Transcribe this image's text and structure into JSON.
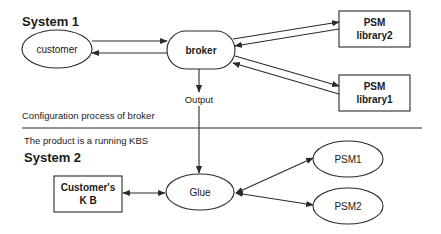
{
  "diagram": {
    "system1": {
      "title": "System 1",
      "nodes": {
        "customer": {
          "label": "customer",
          "shape": "ellipse"
        },
        "broker": {
          "label": "broker",
          "shape": "stadium"
        },
        "psm_library2": {
          "line1": "PSM",
          "line2": "library2",
          "shape": "rectangle"
        },
        "psm_library1": {
          "line1": "PSM",
          "line2": "library1",
          "shape": "rectangle"
        }
      },
      "caption": "Configuration process of broker"
    },
    "output_label": "Output",
    "system2": {
      "caption": "The product is a running KBS",
      "title": "System 2",
      "nodes": {
        "customers_kb": {
          "line1": "Customer's",
          "line2": "K B",
          "shape": "rectangle"
        },
        "glue": {
          "label": "Glue",
          "shape": "ellipse"
        },
        "psm1": {
          "label": "PSM1",
          "shape": "ellipse"
        },
        "psm2": {
          "label": "PSM2",
          "shape": "ellipse"
        }
      }
    },
    "edges": [
      {
        "from": "customer",
        "to": "broker"
      },
      {
        "from": "broker",
        "to": "customer"
      },
      {
        "from": "broker",
        "to": "psm_library2"
      },
      {
        "from": "psm_library2",
        "to": "broker"
      },
      {
        "from": "broker",
        "to": "psm_library1"
      },
      {
        "from": "psm_library1",
        "to": "broker"
      },
      {
        "from": "broker",
        "to": "glue",
        "label": "Output"
      },
      {
        "from": "customers_kb",
        "to": "glue",
        "bidirectional": true
      },
      {
        "from": "glue",
        "to": "psm1",
        "bidirectional": true
      },
      {
        "from": "glue",
        "to": "psm2",
        "bidirectional": true
      }
    ],
    "colors": {
      "stroke": "#2a2a2a",
      "text": "#1a1a1a",
      "background": "#ffffff"
    }
  }
}
